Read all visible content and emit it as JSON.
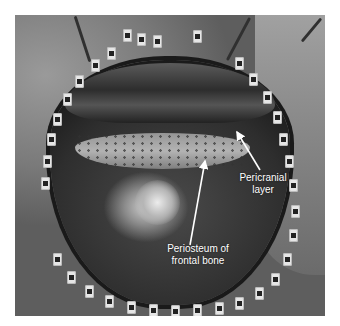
{
  "figure": {
    "annotations": [
      {
        "id": "pericranial",
        "lines": [
          "Pericranial",
          "layer"
        ]
      },
      {
        "id": "periosteum",
        "lines": [
          "Periosteum of",
          "frontal bone"
        ]
      }
    ],
    "colors": {
      "background": "#ffffff",
      "label_text": "#ffffff",
      "arrow": "#ffffff"
    }
  }
}
